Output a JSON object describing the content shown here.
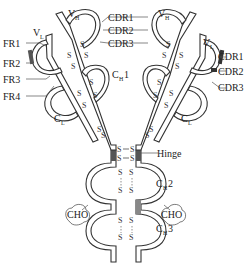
{
  "diagram": {
    "left_labels": {
      "v_h": "V",
      "v_h_sub": "H",
      "v_l": "V",
      "v_l_sub": "L",
      "fr1": "FR1",
      "fr2": "FR2",
      "fr3": "FR3",
      "fr4": "FR4",
      "c_l": "C",
      "c_l_sub": "L"
    },
    "right_labels": {
      "v_h": "V",
      "v_h_sub": "H",
      "v_l": "V",
      "v_l_sub": "L",
      "cdr1": "CDR1",
      "cdr2": "CDR2",
      "cdr3": "CDR3",
      "c_l": "C",
      "c_l_sub": "L"
    },
    "center_labels": {
      "cdr1": "CDR1",
      "cdr2": "CDR2",
      "cdr3": "CDR3",
      "c_h1": "C",
      "c_h1_sub": "H",
      "c_h1_num": "1",
      "hinge": "Hinge",
      "c_h2": "C",
      "c_h2_sub": "H",
      "c_h2_num": "2",
      "c_h3": "C",
      "c_h3_sub": "H",
      "c_h3_num": "3",
      "cho_left": "CHO",
      "cho_right": "CHO"
    },
    "disulfide_glyph": "S"
  }
}
